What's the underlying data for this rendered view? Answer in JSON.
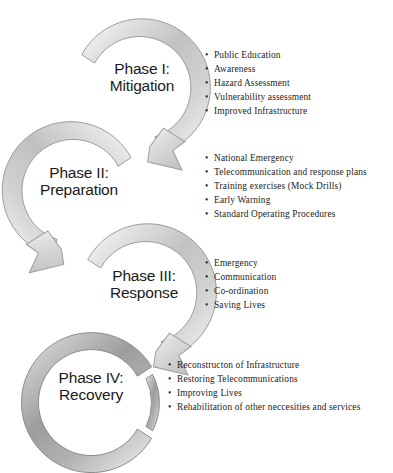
{
  "diagram": {
    "bullet_marker": "•",
    "colors": {
      "ring_light_edge": "#f2f2f2",
      "ring_mid": "#c9c9c9",
      "ring_core": "#b4b4b4",
      "ring_dark": "#8a8a8a",
      "ring_outline": "#9a9a9a",
      "ring_phase4_core": "#9b9b9b",
      "text": "#1a1a1a",
      "background": "#ffffff"
    },
    "phases": [
      {
        "id": "phase-1",
        "label_line1": "Phase I:",
        "label_line2": "Mitigation",
        "bullets": [
          "Public  Education",
          "Awareness",
          "Hazard Assessment",
          "Vulnerability  assessment",
          "Improved Infrastructure"
        ]
      },
      {
        "id": "phase-2",
        "label_line1": "Phase II:",
        "label_line2": "Preparation",
        "bullets": [
          "National  Emergency",
          "Telecommunication  and response plans",
          "Training  exercises (Mock Drills)",
          "Early Warning",
          "Standard Operating  Procedures"
        ]
      },
      {
        "id": "phase-3",
        "label_line1": "Phase III:",
        "label_line2": "Response",
        "bullets": [
          "Emergency",
          "Communication",
          "Co-ordination",
          "Saving  Lives"
        ]
      },
      {
        "id": "phase-4",
        "label_line1": "Phase IV:",
        "label_line2": "Recovery",
        "bullets": [
          "Reconstructon  of Infrastructure",
          "Restoring  Telecommunications",
          "Improving  Lives",
          "Rehabilitation  of other neccesities and services"
        ]
      }
    ]
  }
}
